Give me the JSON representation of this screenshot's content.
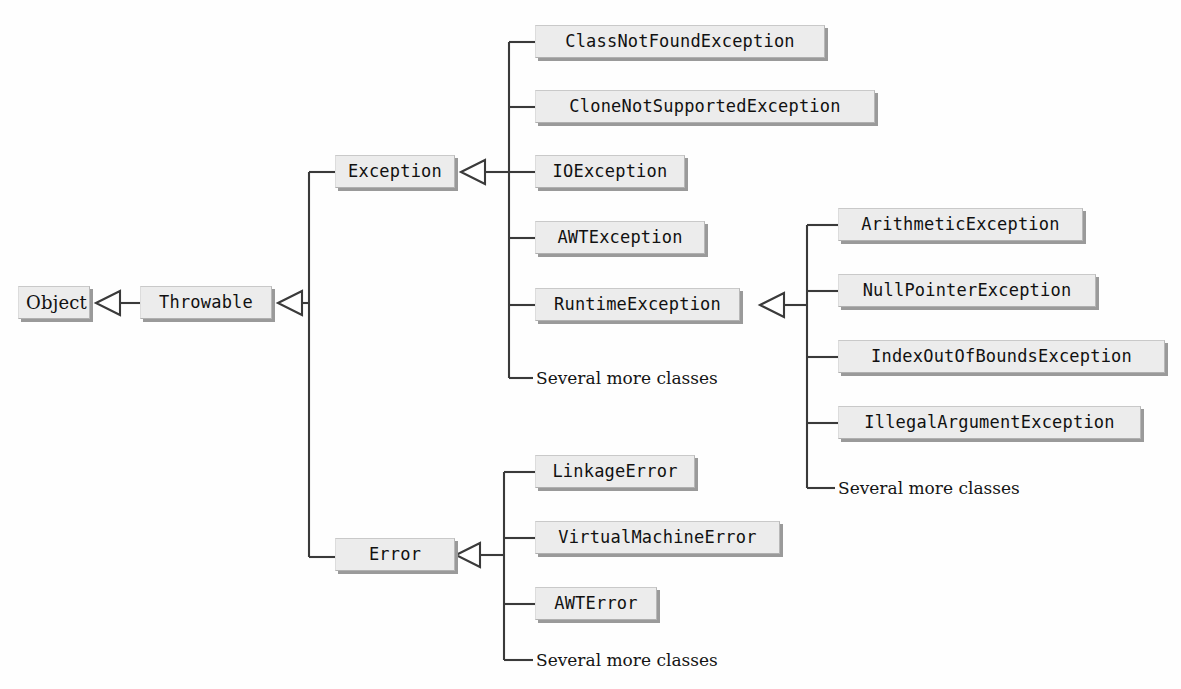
{
  "diagram": {
    "background": "#ffffff",
    "box_fill": "#ececec",
    "box_shadow": "#9a9a9a",
    "line_color": "#3a3a3a",
    "relationship": "inheritance",
    "arrow_style": "hollow-triangle"
  },
  "nodes": {
    "object": {
      "label": "Object",
      "x": 18,
      "y": 286,
      "w": 72,
      "font": "serif"
    },
    "throwable": {
      "label": "Throwable",
      "x": 140,
      "y": 286,
      "w": 132,
      "font": "mono"
    },
    "exception": {
      "label": "Exception",
      "x": 335,
      "y": 155,
      "w": 120,
      "font": "mono"
    },
    "error": {
      "label": "Error",
      "x": 335,
      "y": 538,
      "w": 120,
      "font": "mono"
    },
    "class_not_found": {
      "label": "ClassNotFoundException",
      "x": 535,
      "y": 25,
      "w": 290,
      "font": "mono"
    },
    "clone_not_supported": {
      "label": "CloneNotSupportedException",
      "x": 535,
      "y": 90,
      "w": 340,
      "font": "mono"
    },
    "io_exception": {
      "label": "IOException",
      "x": 535,
      "y": 155,
      "w": 150,
      "font": "mono"
    },
    "awt_exception": {
      "label": "AWTException",
      "x": 535,
      "y": 221,
      "w": 170,
      "font": "mono"
    },
    "runtime_exception": {
      "label": "RuntimeException",
      "x": 535,
      "y": 288,
      "w": 205,
      "font": "mono"
    },
    "arithmetic": {
      "label": "ArithmeticException",
      "x": 838,
      "y": 208,
      "w": 245,
      "font": "mono"
    },
    "null_pointer": {
      "label": "NullPointerException",
      "x": 838,
      "y": 274,
      "w": 258,
      "font": "mono"
    },
    "index_out_of_bounds": {
      "label": "IndexOutOfBoundsException",
      "x": 838,
      "y": 340,
      "w": 327,
      "font": "mono"
    },
    "illegal_argument": {
      "label": "IllegalArgumentException",
      "x": 838,
      "y": 406,
      "w": 303,
      "font": "mono"
    },
    "linkage_error": {
      "label": "LinkageError",
      "x": 535,
      "y": 455,
      "w": 160,
      "font": "mono"
    },
    "virtual_machine_error": {
      "label": "VirtualMachineError",
      "x": 535,
      "y": 521,
      "w": 245,
      "font": "mono"
    },
    "awt_error": {
      "label": "AWTError",
      "x": 535,
      "y": 587,
      "w": 122,
      "font": "mono"
    }
  },
  "more_labels": {
    "exception_more": {
      "text": "Several more classes",
      "x": 536,
      "y": 368
    },
    "runtime_more": {
      "text": "Several more classes",
      "x": 838,
      "y": 478
    },
    "error_more": {
      "text": "Several more classes",
      "x": 536,
      "y": 650
    }
  }
}
